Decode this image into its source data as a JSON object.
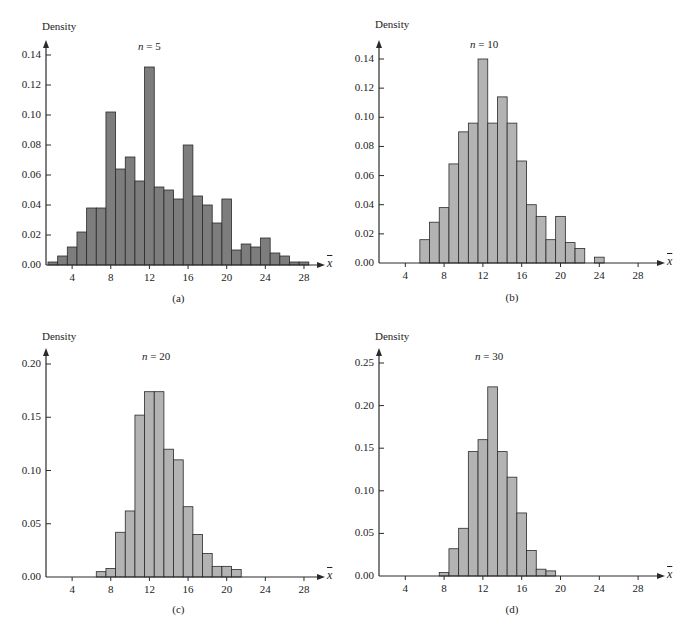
{
  "colors": {
    "panel_a_fill": "#7d7d7d",
    "panel_bcd_fill": "#b3b3b3",
    "stroke": "#2a2a2a"
  },
  "chart_data": [
    {
      "type": "bar",
      "id": "a",
      "title": "n = 5",
      "caption": "(a)",
      "xlabel": "x̄",
      "ylabel": "Density",
      "xlim": [
        1,
        30
      ],
      "ylim": [
        0,
        0.14
      ],
      "x_ticks": [
        4,
        8,
        12,
        16,
        20,
        24,
        28
      ],
      "y_ticks": [
        0.0,
        0.02,
        0.04,
        0.06,
        0.08,
        0.1,
        0.12,
        0.14
      ],
      "y_tick_labels": [
        "0.00",
        "0.02",
        "0.04",
        "0.06",
        "0.08",
        "0.10",
        "0.12",
        "0.14"
      ],
      "bin_width": 1,
      "categories": [
        2,
        3,
        4,
        5,
        6,
        7,
        8,
        9,
        10,
        11,
        12,
        13,
        14,
        15,
        16,
        17,
        18,
        19,
        20,
        21,
        22,
        23,
        24,
        25,
        26,
        27,
        28
      ],
      "values": [
        0.002,
        0.006,
        0.012,
        0.022,
        0.038,
        0.038,
        0.102,
        0.064,
        0.072,
        0.056,
        0.132,
        0.052,
        0.05,
        0.044,
        0.08,
        0.046,
        0.04,
        0.028,
        0.044,
        0.01,
        0.014,
        0.012,
        0.018,
        0.008,
        0.006,
        0.002,
        0.002
      ],
      "grid": false
    },
    {
      "type": "bar",
      "id": "b",
      "title": "n = 10",
      "caption": "(b)",
      "xlabel": "x̄",
      "ylabel": "Density",
      "xlim": [
        1,
        30
      ],
      "ylim": [
        0,
        0.14
      ],
      "x_ticks": [
        4,
        8,
        12,
        16,
        20,
        24,
        28
      ],
      "y_ticks": [
        0.0,
        0.02,
        0.04,
        0.06,
        0.08,
        0.1,
        0.12,
        0.14
      ],
      "y_tick_labels": [
        "0.00",
        "0.02",
        "0.04",
        "0.06",
        "0.08",
        "0.10",
        "0.12",
        "0.14"
      ],
      "bin_width": 1,
      "categories": [
        6,
        7,
        8,
        9,
        10,
        11,
        12,
        13,
        14,
        15,
        16,
        17,
        18,
        19,
        20,
        21,
        22,
        23,
        24
      ],
      "values": [
        0.016,
        0.028,
        0.038,
        0.068,
        0.09,
        0.096,
        0.14,
        0.096,
        0.114,
        0.096,
        0.07,
        0.04,
        0.032,
        0.016,
        0.032,
        0.014,
        0.01,
        0.0,
        0.004
      ],
      "grid": false
    },
    {
      "type": "bar",
      "id": "c",
      "title": "n = 20",
      "caption": "(c)",
      "xlabel": "x̄",
      "ylabel": "Density",
      "xlim": [
        1,
        30
      ],
      "ylim": [
        0,
        0.2
      ],
      "x_ticks": [
        4,
        8,
        12,
        16,
        20,
        24,
        28
      ],
      "y_ticks": [
        0.0,
        0.05,
        0.1,
        0.15,
        0.2
      ],
      "y_tick_labels": [
        "0.00",
        "0.05",
        "0.10",
        "0.15",
        "0.20"
      ],
      "bin_width": 1,
      "categories": [
        7,
        8,
        9,
        10,
        11,
        12,
        13,
        14,
        15,
        16,
        17,
        18,
        19,
        20,
        21
      ],
      "values": [
        0.005,
        0.008,
        0.042,
        0.062,
        0.152,
        0.174,
        0.174,
        0.12,
        0.11,
        0.066,
        0.04,
        0.022,
        0.01,
        0.01,
        0.007
      ],
      "grid": false
    },
    {
      "type": "bar",
      "id": "d",
      "title": "n = 30",
      "caption": "(d)",
      "xlabel": "x̄",
      "ylabel": "Density",
      "xlim": [
        1,
        30
      ],
      "ylim": [
        0,
        0.25
      ],
      "x_ticks": [
        4,
        8,
        12,
        16,
        20,
        24,
        28
      ],
      "y_ticks": [
        0.0,
        0.05,
        0.1,
        0.15,
        0.2,
        0.25
      ],
      "y_tick_labels": [
        "0.00",
        "0.05",
        "0.10",
        "0.15",
        "0.20",
        "0.25"
      ],
      "bin_width": 1,
      "categories": [
        8,
        9,
        10,
        11,
        12,
        13,
        14,
        15,
        16,
        17,
        18,
        19
      ],
      "values": [
        0.004,
        0.032,
        0.056,
        0.146,
        0.16,
        0.222,
        0.146,
        0.116,
        0.074,
        0.03,
        0.008,
        0.006
      ],
      "grid": false
    }
  ],
  "panels": [
    {
      "ylabel": "Density",
      "n_var": "n",
      "n_eq": " = 5",
      "caption": "(a)",
      "xvar": "x"
    },
    {
      "ylabel": "Density",
      "n_var": "n",
      "n_eq": " = 10",
      "caption": "(b)",
      "xvar": "x"
    },
    {
      "ylabel": "Density",
      "n_var": "n",
      "n_eq": " = 20",
      "caption": "(c)",
      "xvar": "x"
    },
    {
      "ylabel": "Density",
      "n_var": "n",
      "n_eq": " = 30",
      "caption": "(d)",
      "xvar": "x"
    }
  ]
}
